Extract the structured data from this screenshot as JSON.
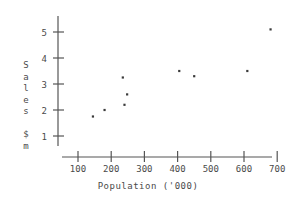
{
  "chart_data": {
    "type": "scatter",
    "title": "",
    "xlabel": "Population ('000)",
    "ylabel": "Sales $m",
    "ylabel_chars": [
      "S",
      "a",
      "l",
      "e",
      "s",
      "",
      "$",
      "m"
    ],
    "xlim": [
      0,
      760
    ],
    "ylim": [
      0.6,
      5.6
    ],
    "xticks": [
      100,
      200,
      300,
      400,
      500,
      600,
      700
    ],
    "xtick_labels": [
      "100",
      "200",
      "300",
      "400",
      "500",
      "600",
      "700"
    ],
    "yticks": [
      1,
      2,
      3,
      4,
      5
    ],
    "ytick_labels": [
      "1",
      "2",
      "3",
      "4",
      "5"
    ],
    "grid": false,
    "legend": false,
    "marker_color": "#3a3a3a",
    "axis_color": "#555555",
    "points": [
      {
        "x": 145,
        "y": 1.75
      },
      {
        "x": 180,
        "y": 2.0
      },
      {
        "x": 235,
        "y": 3.25
      },
      {
        "x": 240,
        "y": 2.2
      },
      {
        "x": 248,
        "y": 2.6
      },
      {
        "x": 405,
        "y": 3.5
      },
      {
        "x": 450,
        "y": 3.3
      },
      {
        "x": 610,
        "y": 3.5
      },
      {
        "x": 680,
        "y": 5.1
      }
    ]
  }
}
